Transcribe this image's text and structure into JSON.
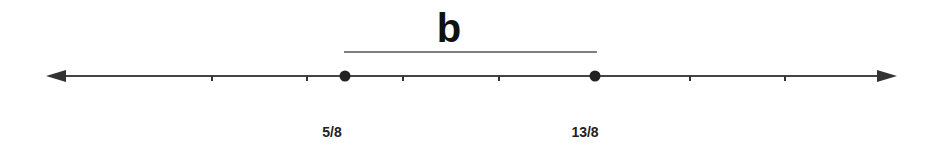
{
  "diagram": {
    "type": "number-line-segment",
    "segment_label": "b",
    "axis": {
      "y": 76,
      "x_start": 46,
      "x_end": 897,
      "color": "#333333",
      "arrows": "both"
    },
    "ticks_x": [
      212,
      307,
      403,
      499,
      690,
      785
    ],
    "points": [
      {
        "label": "5/8",
        "x": 345,
        "label_x": 332
      },
      {
        "label": "13/8",
        "x": 595,
        "label_x": 585
      }
    ],
    "overbar": {
      "x1": 344,
      "x2": 597,
      "y": 52
    }
  }
}
